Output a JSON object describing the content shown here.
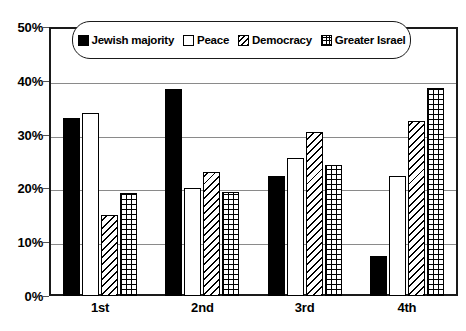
{
  "chart_data": {
    "type": "bar",
    "title": "",
    "subtitle": "",
    "xlabel": "",
    "ylabel": "",
    "ylim": [
      0,
      50
    ],
    "y_ticks": [
      "0%",
      "10%",
      "20%",
      "30%",
      "40%",
      "50%"
    ],
    "y_tick_values": [
      0,
      10,
      20,
      30,
      40,
      50
    ],
    "grid": true,
    "legend_position": "top-center",
    "categories": [
      "1st",
      "2nd",
      "3rd",
      "4th"
    ],
    "series": [
      {
        "name": "Jewish majority",
        "pattern": "solid",
        "values": [
          33,
          38.4,
          22.4,
          7.5
        ]
      },
      {
        "name": "Peace",
        "pattern": "empty",
        "values": [
          34,
          20,
          25.6,
          22.4
        ]
      },
      {
        "name": "Democracy",
        "pattern": "diagonal-hatch",
        "values": [
          15,
          23,
          30.4,
          32.6
        ]
      },
      {
        "name": "Greater Israel",
        "pattern": "crosshatch-grid",
        "values": [
          19.2,
          19.4,
          24.4,
          38.6
        ]
      }
    ],
    "colors": {
      "ink": "#000000",
      "gridline": "#8a8a8a",
      "background": "#ffffff"
    }
  },
  "legend": {
    "items": [
      {
        "label": "Jewish majority",
        "pattern": "solid"
      },
      {
        "label": "Peace",
        "pattern": "empty"
      },
      {
        "label": "Democracy",
        "pattern": "diagonal-hatch"
      },
      {
        "label": "Greater Israel",
        "pattern": "crosshatch-grid"
      }
    ]
  }
}
